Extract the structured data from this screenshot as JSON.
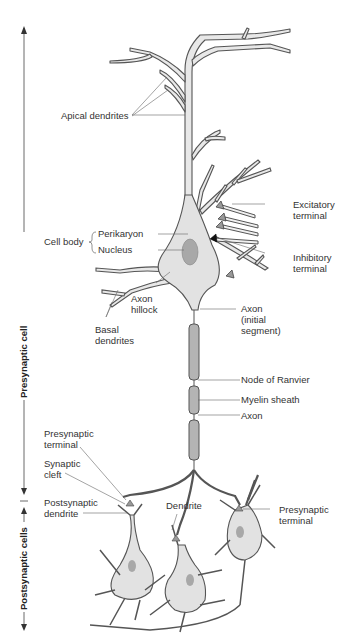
{
  "diagram": {
    "type": "neuron-anatomy",
    "colors": {
      "outline": "#555555",
      "cytoplasm": "#e2e2e2",
      "nucleus": "#a8a8a8",
      "myelin": "#b4b4b4",
      "label_text": "#333333",
      "leader_line": "#666666"
    },
    "side_labels": {
      "presynaptic": "Presynaptic cell",
      "postsynaptic": "Postsynaptic cells"
    },
    "labels": {
      "apical_dendrites": "Apical dendrites",
      "cell_body": "Cell body",
      "perikaryon": "Perikaryon",
      "nucleus": "Nucleus",
      "excitatory_terminal_1": "Excitatory",
      "excitatory_terminal_2": "terminal",
      "inhibitory_terminal_1": "Inhibitory",
      "inhibitory_terminal_2": "terminal",
      "axon_hillock_1": "Axon",
      "axon_hillock_2": "hillock",
      "basal_dendrites_1": "Basal",
      "basal_dendrites_2": "dendrites",
      "axon_initial_1": "Axon",
      "axon_initial_2": "(initial",
      "axon_initial_3": "segment)",
      "node_of_ranvier": "Node of Ranvier",
      "myelin_sheath": "Myelin sheath",
      "axon": "Axon",
      "presynaptic_terminal_left_1": "Presynaptic",
      "presynaptic_terminal_left_2": "terminal",
      "synaptic_cleft_1": "Synaptic",
      "synaptic_cleft_2": "cleft",
      "postsynaptic_dendrite_1": "Postsynaptic",
      "postsynaptic_dendrite_2": "dendrite",
      "dendrite": "Dendrite",
      "presynaptic_terminal_right_1": "Presynaptic",
      "presynaptic_terminal_right_2": "terminal"
    }
  }
}
